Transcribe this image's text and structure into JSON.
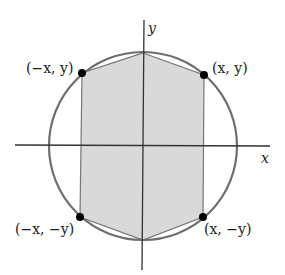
{
  "diagram": {
    "axes": {
      "x_label": "x",
      "y_label": "y"
    },
    "points": [
      {
        "id": "top-left",
        "label": "(−x, y)"
      },
      {
        "id": "top-right",
        "label": "(x, y)"
      },
      {
        "id": "bottom-left",
        "label": "(−x, −y)"
      },
      {
        "id": "bottom-right",
        "label": "(x, −y)"
      }
    ],
    "colors": {
      "circle": "#6e6e6e",
      "fill": "#d9d9d9",
      "line": "#555555",
      "point": "#000000"
    }
  }
}
